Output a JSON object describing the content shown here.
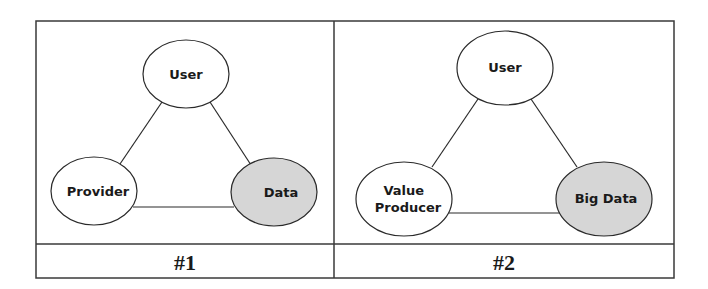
{
  "colors": {
    "border": "#3a3a3a",
    "line": "#2a2a2a",
    "node_fill": "#ffffff",
    "highlight_fill": "#d6d6d6",
    "text": "#1a1a1a"
  },
  "panels": [
    {
      "caption": "#1",
      "nodes": {
        "top": {
          "label": "User",
          "lines": [
            "User"
          ],
          "highlighted": false
        },
        "left": {
          "label": "Provider",
          "lines": [
            "Provider"
          ],
          "highlighted": false
        },
        "right": {
          "label": "Data",
          "lines": [
            "Data"
          ],
          "highlighted": true
        }
      }
    },
    {
      "caption": "#2",
      "nodes": {
        "top": {
          "label": "User",
          "lines": [
            "User"
          ],
          "highlighted": false
        },
        "left": {
          "label": "Value Producer",
          "lines": [
            "Value",
            "Producer"
          ],
          "highlighted": false
        },
        "right": {
          "label": "Big Data",
          "lines": [
            "Big Data"
          ],
          "highlighted": true
        }
      }
    }
  ]
}
